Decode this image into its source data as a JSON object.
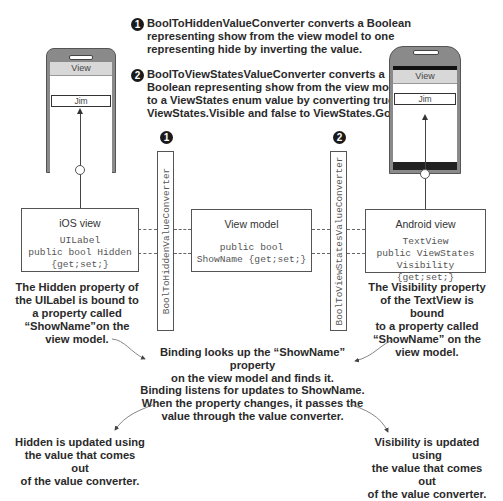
{
  "notes": {
    "n1": {
      "badge": "1",
      "lines": [
        "BoolToHiddenValueConverter converts a Boolean",
        "representing show from the view model to one",
        "representing hide by inverting the value."
      ]
    },
    "n2": {
      "badge": "2",
      "lines": [
        "BoolToViewStatesValueConverter converts a",
        "Boolean representing show from the view model",
        "to a ViewStates enum value by converting true to",
        "ViewStates.Visible and false to ViewStates.Gone."
      ]
    }
  },
  "ios_phone": {
    "view_label": "View",
    "field_value": "Jim"
  },
  "android_phone": {
    "view_label": "View",
    "field_value": "Jim"
  },
  "converters": {
    "left": {
      "badge": "1",
      "label": "BoolToHiddenValueConverter"
    },
    "right": {
      "badge": "2",
      "label": "BoolToViewStatesValueConverter"
    }
  },
  "boxes": {
    "ios": {
      "title": "iOS view",
      "code": [
        "UILabel",
        "public bool Hidden",
        "{get;set;}"
      ]
    },
    "viewmodel": {
      "title": "View model",
      "code": [
        "public bool",
        "ShowName {get;set;}"
      ]
    },
    "android": {
      "title": "Android view",
      "code": [
        "TextView",
        "public ViewStates",
        "Visibility {get;set;}"
      ]
    }
  },
  "captions": {
    "ios_binding": [
      "The Hidden property of",
      "the UILabel is bound to",
      "a property called",
      "“ShowName”on the",
      "view model."
    ],
    "android_binding": [
      "The Visibility property",
      "of the TextView is bound",
      "to a property called",
      "“ShowName” on the",
      "view model."
    ],
    "lookup": [
      "Binding looks up the “ShowName” property",
      "on the view model and finds it."
    ],
    "listen": [
      "Binding listens for updates to ShowName.",
      "When the property changes, it passes the",
      "value through the value converter."
    ],
    "hidden_update": [
      "Hidden is updated using",
      "the value that comes out",
      "of the value converter."
    ],
    "visibility_update": [
      "Visibility is updated using",
      "the value that comes out",
      "of the value converter."
    ]
  }
}
